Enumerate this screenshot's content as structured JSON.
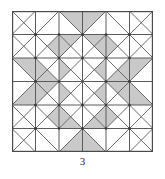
{
  "figure": {
    "caption": "3",
    "width": 141,
    "height": 141,
    "grid": {
      "rows": 6,
      "cols": 6,
      "cell": 23.5
    },
    "colors": {
      "background": "#ffffff",
      "shade": "#c9c9c9",
      "shade_light": "#d8d8d8",
      "line": "#5a5a5a",
      "border": "#4a4a4a",
      "caption": "#2b2b2b"
    },
    "stroke_width": 0.9,
    "border_width": 1.2
  },
  "chart_data": {
    "type": "diagram",
    "title": "3",
    "grid_rows": 6,
    "grid_cols": 6,
    "cell_size": 23.5,
    "legend": [],
    "diagonals": [
      {
        "row": 0,
        "col": 0,
        "kind": "both"
      },
      {
        "row": 0,
        "col": 1,
        "kind": "anti"
      },
      {
        "row": 0,
        "col": 2,
        "kind": "main"
      },
      {
        "row": 0,
        "col": 3,
        "kind": "anti"
      },
      {
        "row": 0,
        "col": 4,
        "kind": "main"
      },
      {
        "row": 0,
        "col": 5,
        "kind": "both"
      },
      {
        "row": 1,
        "col": 0,
        "kind": "both"
      },
      {
        "row": 1,
        "col": 1,
        "kind": "both"
      },
      {
        "row": 1,
        "col": 2,
        "kind": "both"
      },
      {
        "row": 1,
        "col": 3,
        "kind": "both"
      },
      {
        "row": 1,
        "col": 4,
        "kind": "both"
      },
      {
        "row": 1,
        "col": 5,
        "kind": "both"
      },
      {
        "row": 2,
        "col": 0,
        "kind": "main"
      },
      {
        "row": 2,
        "col": 1,
        "kind": "both"
      },
      {
        "row": 2,
        "col": 2,
        "kind": "both"
      },
      {
        "row": 2,
        "col": 3,
        "kind": "both"
      },
      {
        "row": 2,
        "col": 4,
        "kind": "both"
      },
      {
        "row": 2,
        "col": 5,
        "kind": "anti"
      },
      {
        "row": 3,
        "col": 0,
        "kind": "anti"
      },
      {
        "row": 3,
        "col": 1,
        "kind": "both"
      },
      {
        "row": 3,
        "col": 2,
        "kind": "both"
      },
      {
        "row": 3,
        "col": 3,
        "kind": "both"
      },
      {
        "row": 3,
        "col": 4,
        "kind": "both"
      },
      {
        "row": 3,
        "col": 5,
        "kind": "main"
      },
      {
        "row": 4,
        "col": 0,
        "kind": "both"
      },
      {
        "row": 4,
        "col": 1,
        "kind": "both"
      },
      {
        "row": 4,
        "col": 2,
        "kind": "both"
      },
      {
        "row": 4,
        "col": 3,
        "kind": "both"
      },
      {
        "row": 4,
        "col": 4,
        "kind": "both"
      },
      {
        "row": 4,
        "col": 5,
        "kind": "both"
      },
      {
        "row": 5,
        "col": 0,
        "kind": "both"
      },
      {
        "row": 5,
        "col": 1,
        "kind": "main"
      },
      {
        "row": 5,
        "col": 2,
        "kind": "anti"
      },
      {
        "row": 5,
        "col": 3,
        "kind": "main"
      },
      {
        "row": 5,
        "col": 4,
        "kind": "anti"
      },
      {
        "row": 5,
        "col": 5,
        "kind": "both"
      }
    ],
    "shaded_triangles": [
      {
        "row": 0,
        "col": 2,
        "part": "upper-right"
      },
      {
        "row": 0,
        "col": 3,
        "part": "upper-left"
      },
      {
        "row": 1,
        "col": 1,
        "part": "right"
      },
      {
        "row": 1,
        "col": 2,
        "part": "top"
      },
      {
        "row": 1,
        "col": 2,
        "part": "left"
      },
      {
        "row": 1,
        "col": 3,
        "part": "top"
      },
      {
        "row": 1,
        "col": 3,
        "part": "right"
      },
      {
        "row": 1,
        "col": 4,
        "part": "left"
      },
      {
        "row": 2,
        "col": 0,
        "part": "upper-right"
      },
      {
        "row": 2,
        "col": 1,
        "part": "bottom"
      },
      {
        "row": 2,
        "col": 1,
        "part": "left"
      },
      {
        "row": 2,
        "col": 2,
        "part": "left"
      },
      {
        "row": 2,
        "col": 3,
        "part": "right"
      },
      {
        "row": 2,
        "col": 4,
        "part": "bottom"
      },
      {
        "row": 2,
        "col": 4,
        "part": "right"
      },
      {
        "row": 2,
        "col": 5,
        "part": "upper-left"
      },
      {
        "row": 3,
        "col": 0,
        "part": "lower-right"
      },
      {
        "row": 3,
        "col": 1,
        "part": "top"
      },
      {
        "row": 3,
        "col": 1,
        "part": "left"
      },
      {
        "row": 3,
        "col": 2,
        "part": "left"
      },
      {
        "row": 3,
        "col": 3,
        "part": "right"
      },
      {
        "row": 3,
        "col": 4,
        "part": "top"
      },
      {
        "row": 3,
        "col": 4,
        "part": "right"
      },
      {
        "row": 3,
        "col": 5,
        "part": "lower-left"
      },
      {
        "row": 4,
        "col": 1,
        "part": "right"
      },
      {
        "row": 4,
        "col": 2,
        "part": "bottom"
      },
      {
        "row": 4,
        "col": 2,
        "part": "left"
      },
      {
        "row": 4,
        "col": 3,
        "part": "bottom"
      },
      {
        "row": 4,
        "col": 3,
        "part": "right"
      },
      {
        "row": 4,
        "col": 4,
        "part": "left"
      },
      {
        "row": 5,
        "col": 2,
        "part": "lower-right"
      },
      {
        "row": 5,
        "col": 3,
        "part": "lower-left"
      }
    ]
  }
}
